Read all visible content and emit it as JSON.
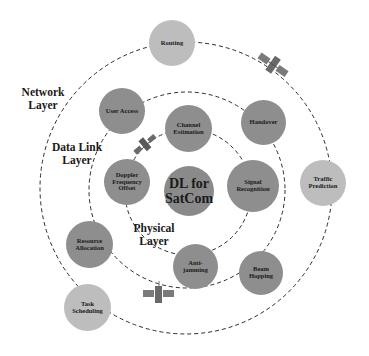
{
  "diagram": {
    "title": "DL for SatCom",
    "center": {
      "label_line1": "DL for",
      "label_line2": "SatCom"
    },
    "layers": {
      "network": {
        "label_line1": "Network",
        "label_line2": "Layer"
      },
      "datalink": {
        "label_line1": "Data Link",
        "label_line2": "Layer"
      },
      "physical": {
        "label_line1": "Physical",
        "label_line2": "Layer"
      }
    },
    "nodes": {
      "routing": {
        "line1": "Routing",
        "line2": "",
        "layer": "network"
      },
      "traffic_prediction": {
        "line1": "Traffic",
        "line2": "Prediction",
        "layer": "network"
      },
      "task_scheduling": {
        "line1": "Task",
        "line2": "Scheduling",
        "layer": "network"
      },
      "user_access": {
        "line1": "User Access",
        "line2": "",
        "layer": "datalink"
      },
      "handover": {
        "line1": "Handover",
        "line2": "",
        "layer": "datalink"
      },
      "beam_hopping": {
        "line1": "Beam",
        "line2": "Hopping",
        "layer": "datalink"
      },
      "resource_allocation": {
        "line1": "Resource",
        "line2": "Allocation",
        "layer": "datalink"
      },
      "channel_estimation": {
        "line1": "Channel",
        "line2": "Estimation",
        "layer": "physical"
      },
      "doppler_frequency_offset": {
        "line1": "Doppler",
        "line2": "Frequency",
        "line3": "Offset",
        "layer": "physical"
      },
      "signal_recognition": {
        "line1": "Signal",
        "line2": "Recognition",
        "layer": "physical"
      },
      "anti_jamming": {
        "line1": "Anti-",
        "line2": "jamming",
        "layer": "physical"
      }
    },
    "colors": {
      "network_node": "#bdbdbd",
      "inner_node": "#8e8e8e",
      "ring": "#2a2a2a",
      "satellite": "#7a7a7a"
    }
  }
}
